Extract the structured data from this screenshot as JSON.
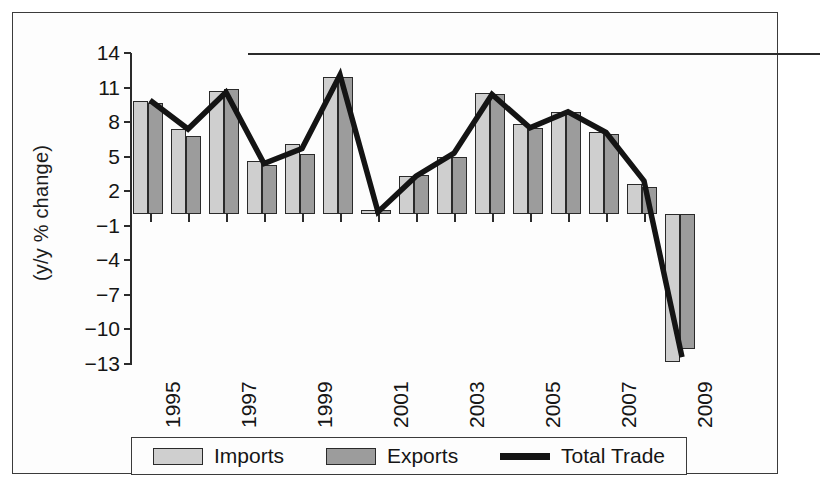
{
  "chart_data": {
    "type": "bar",
    "title": "",
    "xlabel": "",
    "ylabel": "(y/y % change)",
    "ylim": [
      -13,
      14
    ],
    "ytick_values": [
      14,
      11,
      8,
      5,
      2,
      -1,
      -4,
      -7,
      -10,
      -13
    ],
    "ytick_labels": [
      "14",
      "11",
      "8",
      "5",
      "2",
      "−1",
      "−4",
      "−7",
      "−10",
      "−13"
    ],
    "grid": false,
    "legend_position": "bottom",
    "categories": [
      1995,
      1996,
      1997,
      1998,
      1999,
      2000,
      2001,
      2002,
      2003,
      2004,
      2005,
      2006,
      2007,
      2008,
      2009
    ],
    "xtick_labels": [
      "1995",
      "1997",
      "1999",
      "2001",
      "2003",
      "2005",
      "2007",
      "2009"
    ],
    "xtick_categories": [
      1995,
      1997,
      1999,
      2001,
      2003,
      2005,
      2007,
      2009
    ],
    "series": [
      {
        "name": "Imports",
        "kind": "bar",
        "color": "#cfcfcf",
        "values": [
          9.8,
          7.4,
          10.7,
          4.6,
          6.1,
          11.9,
          0.4,
          3.3,
          5.0,
          10.5,
          7.8,
          8.9,
          7.1,
          2.6,
          -12.8
        ]
      },
      {
        "name": "Exports",
        "kind": "bar",
        "color": "#9c9c9c",
        "values": [
          9.7,
          6.8,
          10.9,
          4.3,
          5.2,
          11.9,
          0.4,
          3.4,
          5.0,
          10.4,
          7.5,
          8.9,
          7.0,
          2.4,
          -11.7
        ]
      },
      {
        "name": "Total Trade",
        "kind": "line",
        "color": "#141414",
        "values": [
          9.9,
          7.4,
          10.6,
          4.4,
          5.7,
          12.1,
          0.2,
          3.3,
          5.3,
          10.4,
          7.5,
          8.9,
          7.1,
          2.9,
          -12.4
        ]
      }
    ]
  },
  "legend": {
    "items": [
      {
        "label": "Imports",
        "marker": "swatch-light"
      },
      {
        "label": "Exports",
        "marker": "swatch-dark"
      },
      {
        "label": "Total Trade",
        "marker": "line-black"
      }
    ]
  }
}
